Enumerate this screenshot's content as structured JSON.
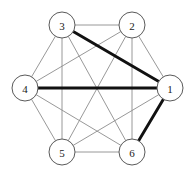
{
  "figure": {
    "background_color": "#ffffff",
    "width": 194,
    "height": 177
  },
  "style": {
    "thin_edge_color": "#8c8c8c",
    "thin_edge_width": 0.9,
    "bold_edge_color": "#111111",
    "bold_edge_width": 2.9,
    "node_fill": "#ffffff",
    "node_stroke": "#5a5a5a",
    "node_radius": 13,
    "label_color": "#1a1a1a"
  },
  "graph": {
    "type": "undirected",
    "node_count": 6,
    "edge_count": 15,
    "nodes": [
      {
        "id": "1",
        "label": "1",
        "x": 170,
        "y": 88
      },
      {
        "id": "2",
        "label": "2",
        "x": 132,
        "y": 25
      },
      {
        "id": "3",
        "label": "3",
        "x": 62,
        "y": 25
      },
      {
        "id": "4",
        "label": "4",
        "x": 25,
        "y": 88
      },
      {
        "id": "5",
        "label": "5",
        "x": 62,
        "y": 152
      },
      {
        "id": "6",
        "label": "6",
        "x": 132,
        "y": 152
      }
    ],
    "edges": [
      {
        "from": "1",
        "to": "2",
        "weight": "thin"
      },
      {
        "from": "1",
        "to": "3",
        "weight": "bold"
      },
      {
        "from": "1",
        "to": "4",
        "weight": "bold"
      },
      {
        "from": "1",
        "to": "5",
        "weight": "thin"
      },
      {
        "from": "1",
        "to": "6",
        "weight": "bold"
      },
      {
        "from": "2",
        "to": "3",
        "weight": "thin"
      },
      {
        "from": "2",
        "to": "4",
        "weight": "thin"
      },
      {
        "from": "2",
        "to": "5",
        "weight": "thin"
      },
      {
        "from": "2",
        "to": "6",
        "weight": "thin"
      },
      {
        "from": "3",
        "to": "4",
        "weight": "thin"
      },
      {
        "from": "3",
        "to": "5",
        "weight": "thin"
      },
      {
        "from": "3",
        "to": "6",
        "weight": "thin"
      },
      {
        "from": "4",
        "to": "5",
        "weight": "thin"
      },
      {
        "from": "4",
        "to": "6",
        "weight": "thin"
      },
      {
        "from": "5",
        "to": "6",
        "weight": "thin"
      }
    ],
    "highlighted_edges": [
      {
        "from": "1",
        "to": "3"
      },
      {
        "from": "1",
        "to": "4"
      },
      {
        "from": "1",
        "to": "6"
      }
    ]
  }
}
